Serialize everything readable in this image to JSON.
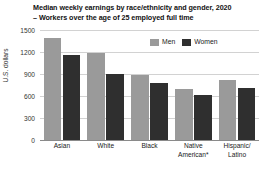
{
  "chart_data": {
    "type": "bar",
    "title": "Median weekly earnings by race/ethnicity and gender, 2020",
    "subtitle": "– Workers over the age of 25 employed full time",
    "xlabel": "",
    "ylabel": "U.S. dollars",
    "ylim": [
      0,
      1500
    ],
    "yticks": [
      0,
      300,
      600,
      900,
      1200,
      1500
    ],
    "ytick_labels": [
      "0",
      "300",
      "600",
      "900",
      "1200",
      "1500"
    ],
    "grid": true,
    "legend_position": "top-right",
    "categories": [
      "Asian",
      "White",
      "Black",
      "Native American*",
      "Hispanic/ Latino"
    ],
    "category_lines": [
      [
        "Asian"
      ],
      [
        "White"
      ],
      [
        "Black"
      ],
      [
        "Native",
        "American*"
      ],
      [
        "Hispanic/",
        "Latino"
      ]
    ],
    "series": [
      {
        "name": "Men",
        "color": "#9a9a9a",
        "values": [
          1390,
          1180,
          890,
          700,
          820
        ]
      },
      {
        "name": "Women",
        "color": "#2f2f2f",
        "values": [
          1160,
          900,
          780,
          615,
          710
        ]
      }
    ]
  },
  "legend": {
    "items": [
      {
        "label": "Men"
      },
      {
        "label": "Women"
      }
    ]
  },
  "colors": {
    "men": "#9a9a9a",
    "women": "#2f2f2f",
    "grid": "#d2d2d2",
    "axis": "#8a8a8a",
    "text": "#1a1a1a",
    "background": "#ffffff"
  }
}
